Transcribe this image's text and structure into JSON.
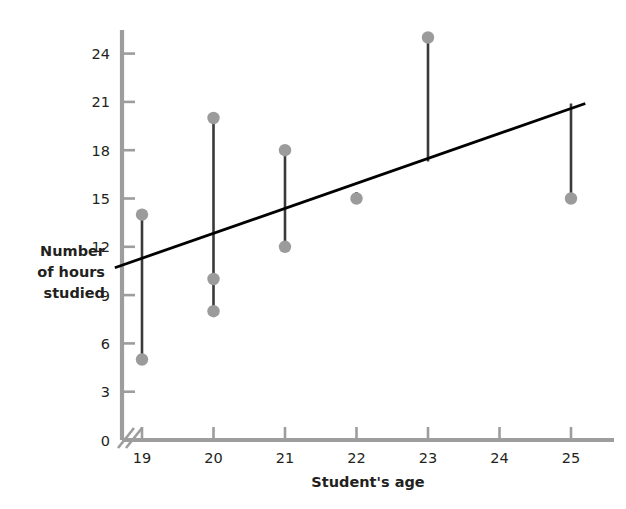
{
  "chart_data": {
    "type": "scatter",
    "title": "",
    "xlabel": "Student's age",
    "ylabel": "Number of hours studied",
    "ylabel_lines": [
      "Number",
      "of hours",
      "studied"
    ],
    "xlim": [
      18.62,
      25.45
    ],
    "ylim": [
      0,
      25.8
    ],
    "xticks": [
      19,
      20,
      21,
      22,
      23,
      24,
      25
    ],
    "xtick_labels": [
      "19",
      "20",
      "21",
      "22",
      "23",
      "24",
      "25"
    ],
    "yticks": [
      0,
      3,
      6,
      9,
      12,
      15,
      18,
      21,
      24
    ],
    "ytick_labels": [
      "0",
      "3",
      "6",
      "9",
      "12",
      "15",
      "18",
      "21",
      "24"
    ],
    "grid": false,
    "legend": null,
    "axis_break": {
      "axis": "x",
      "present": true,
      "note": "broken-axis slash near origin"
    },
    "points": [
      {
        "x": 19,
        "y": 14
      },
      {
        "x": 19,
        "y": 5
      },
      {
        "x": 20,
        "y": 20
      },
      {
        "x": 20,
        "y": 10
      },
      {
        "x": 20,
        "y": 8
      },
      {
        "x": 21,
        "y": 18
      },
      {
        "x": 21,
        "y": 12
      },
      {
        "x": 22,
        "y": 15
      },
      {
        "x": 23,
        "y": 25
      },
      {
        "x": 25,
        "y": 15
      }
    ],
    "residual_segments": [
      {
        "x": 19,
        "y_top": 14,
        "y_bottom": 5
      },
      {
        "x": 20,
        "y_top": 20,
        "y_bottom": 8
      },
      {
        "x": 21,
        "y_top": 18,
        "y_bottom": 12
      },
      {
        "x": 22,
        "y_top": 15.4,
        "y_bottom": 15
      },
      {
        "x": 23,
        "y_top": 25,
        "y_bottom": 17.3
      },
      {
        "x": 25,
        "y_top": 20.9,
        "y_bottom": 15
      }
    ],
    "regression_line": {
      "x_start": 18.62,
      "y_start": 10.7,
      "x_end": 25.2,
      "y_end": 20.9,
      "slope": 1.55,
      "intercept": -18.16,
      "color": "#000000"
    },
    "colors": {
      "point": "#9b9b9b",
      "segment": "#3a3a3a",
      "line": "#000000",
      "axis": "#9d9d9d",
      "text": "#231f20"
    }
  }
}
